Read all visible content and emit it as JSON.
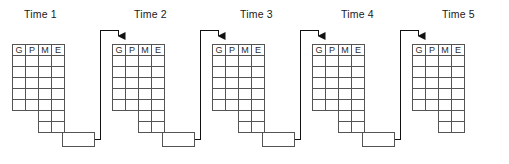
{
  "diagram": {
    "background_color": "#ffffff",
    "line_color": "#4a4a4a",
    "connector_color": "#1a1a1a",
    "text_color": "#1a1a1a",
    "columns": [
      "G",
      "P",
      "M",
      "E"
    ],
    "full_row_count": 5,
    "tail_row_count": 2,
    "tail_columns": [
      "M",
      "E"
    ],
    "adjust_label": "Adjust",
    "groups": [
      {
        "id": "time-1",
        "label": "Time 1",
        "has_adjust": true,
        "has_incoming_arrow": false,
        "columns": [
          "G",
          "P",
          "M",
          "E"
        ],
        "table_x": 12,
        "table_y": 44,
        "adjust_x": 62,
        "adjust_y": 133
      },
      {
        "id": "time-2",
        "label": "Time 2",
        "has_adjust": true,
        "has_incoming_arrow": true,
        "columns": [
          "G",
          "P",
          "M",
          "E"
        ],
        "table_x": 112,
        "table_y": 44,
        "adjust_x": 162,
        "adjust_y": 133
      },
      {
        "id": "time-3",
        "label": "Time 3",
        "has_adjust": true,
        "has_incoming_arrow": true,
        "columns": [
          "G",
          "P",
          "M",
          "E"
        ],
        "table_x": 212,
        "table_y": 44,
        "adjust_x": 262,
        "adjust_y": 133
      },
      {
        "id": "time-4",
        "label": "Time 4",
        "has_adjust": true,
        "has_incoming_arrow": true,
        "columns": [
          "G",
          "P",
          "M",
          "E"
        ],
        "table_x": 312,
        "table_y": 44,
        "adjust_x": 362,
        "adjust_y": 133
      },
      {
        "id": "time-5",
        "label": "Time 5",
        "has_adjust": false,
        "has_incoming_arrow": true,
        "columns": [
          "G",
          "P",
          "M",
          "E"
        ],
        "table_x": 412,
        "table_y": 44,
        "adjust_x": null,
        "adjust_y": null
      }
    ],
    "connectors": [
      {
        "id": "connector-1-2",
        "from": "time-1-adjust",
        "to": "time-2-table-g"
      },
      {
        "id": "connector-2-3",
        "from": "time-2-adjust",
        "to": "time-3-table-g"
      },
      {
        "id": "connector-3-4",
        "from": "time-3-adjust",
        "to": "time-4-table-g"
      },
      {
        "id": "connector-4-5",
        "from": "time-4-adjust",
        "to": "time-5-table-g"
      }
    ],
    "geometry": {
      "col_width": 13,
      "row_height": 11,
      "header_height": 11,
      "adjust_width": 32,
      "adjust_height": 14,
      "label_y": 14
    }
  }
}
